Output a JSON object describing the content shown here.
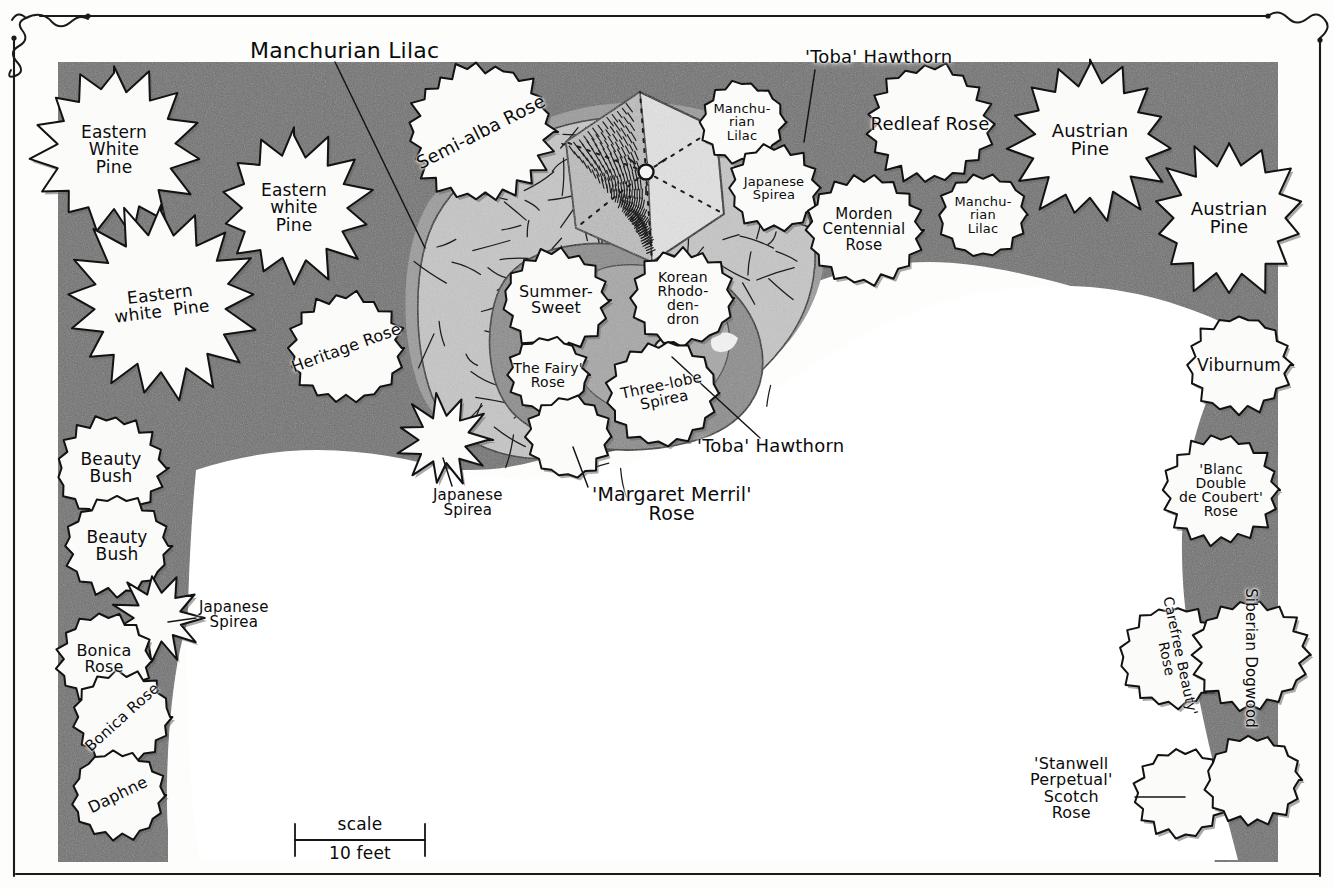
{
  "document": {
    "type": "landscape-planting-plan",
    "title": "Residential Foundation Planting Plan",
    "medium": "hand-drawn pen and ink with grey marker tone"
  },
  "scale_bar": {
    "name": "scale-bar",
    "top_label": "scale",
    "bottom_label": "10 feet",
    "x": 295,
    "y": 840,
    "length_px": 130
  },
  "frame": {
    "name": "decorative-border",
    "corner_flourish": "squiggle"
  },
  "tones": {
    "paper": "#fdfdfc",
    "lawn": "#ffffff",
    "bed_dark": "#6d6d6d",
    "bed_mid": "#8f8f8f",
    "bed_light": "#b4b4b4",
    "paving": "#c9c9c9",
    "plant_fill": "#fbfbfa",
    "ink": "#111111"
  },
  "plants": [
    {
      "id": "eastern-white-pine-1",
      "label": "Eastern\nWhite\nPine",
      "cx": 114,
      "cy": 150,
      "r": 66,
      "shape": "conifer",
      "rot": 0,
      "fs": 17
    },
    {
      "id": "eastern-white-pine-2",
      "label": "Eastern\nwhite\nPine",
      "cx": 294,
      "cy": 208,
      "r": 60,
      "shape": "conifer",
      "rot": 0,
      "fs": 17
    },
    {
      "id": "eastern-white-pine-3",
      "label": "Eastern\nwhite  Pine",
      "cx": 161,
      "cy": 303,
      "r": 76,
      "shape": "conifer",
      "rot": -7,
      "fs": 17
    },
    {
      "id": "semi-alba-rose",
      "label": "Semi-alba Rose",
      "cx": 481,
      "cy": 132,
      "r": 68,
      "shape": "shrub",
      "rot": -27,
      "fs": 18
    },
    {
      "id": "heritage-rose",
      "label": "Heritage Rose",
      "cx": 346,
      "cy": 348,
      "r": 54,
      "shape": "shrub",
      "rot": -20,
      "fs": 16
    },
    {
      "id": "beauty-bush-1",
      "label": "Beauty\nBush",
      "cx": 111,
      "cy": 468,
      "r": 51,
      "shape": "shrub",
      "rot": 0,
      "fs": 17
    },
    {
      "id": "beauty-bush-2",
      "label": "Beauty\nBush",
      "cx": 117,
      "cy": 546,
      "r": 49,
      "shape": "shrub",
      "rot": 0,
      "fs": 17
    },
    {
      "id": "japanese-spirea-left",
      "label": "",
      "cx": 158,
      "cy": 618,
      "r": 35,
      "shape": "spiky",
      "rot": 0,
      "fs": 13
    },
    {
      "id": "bonica-rose-1",
      "label": "Bonica\nRose",
      "cx": 104,
      "cy": 659,
      "r": 44,
      "shape": "shrub",
      "rot": 0,
      "fs": 16
    },
    {
      "id": "bonica-rose-2",
      "label": "Bonica Rose",
      "cx": 122,
      "cy": 717,
      "r": 46,
      "shape": "shrub",
      "rot": -42,
      "fs": 15
    },
    {
      "id": "daphne",
      "label": "Daphne",
      "cx": 118,
      "cy": 795,
      "r": 44,
      "shape": "shrub",
      "rot": -26,
      "fs": 16
    },
    {
      "id": "summer-sweet",
      "label": "Summer-\nSweet",
      "cx": 556,
      "cy": 300,
      "r": 50,
      "shape": "shrub",
      "rot": 0,
      "fs": 16
    },
    {
      "id": "the-fairy-rose",
      "label": "The Fairy'\nRose",
      "cx": 548,
      "cy": 375,
      "r": 38,
      "shape": "shrub",
      "rot": 0,
      "fs": 14
    },
    {
      "id": "korean-rhododendron",
      "label": "Korean\nRhodo-\nden-\ndron",
      "cx": 683,
      "cy": 298,
      "r": 48,
      "shape": "shrub",
      "rot": 0,
      "fs": 14
    },
    {
      "id": "three-lobe-spirea",
      "label": "Three-lobe\nSpirea",
      "cx": 663,
      "cy": 393,
      "r": 52,
      "shape": "shrub",
      "rot": -12,
      "fs": 15
    },
    {
      "id": "margaret-merril-rose",
      "label": "",
      "cx": 568,
      "cy": 437,
      "r": 40,
      "shape": "shrub",
      "rot": 0,
      "fs": 13
    },
    {
      "id": "japanese-spirea-mid",
      "label": "",
      "cx": 443,
      "cy": 440,
      "r": 36,
      "shape": "spiky",
      "rot": 0,
      "fs": 13
    },
    {
      "id": "manchurian-lilac-top",
      "label": "Manchu-\nrian\nLilac",
      "cx": 742,
      "cy": 122,
      "r": 40,
      "shape": "shrub",
      "rot": 0,
      "fs": 13
    },
    {
      "id": "japanese-spirea-top",
      "label": "Japanese\nSpirea",
      "cx": 774,
      "cy": 188,
      "r": 42,
      "shape": "shrub",
      "rot": 0,
      "fs": 13
    },
    {
      "id": "redleaf-rose",
      "label": "Redleaf Rose",
      "cx": 930,
      "cy": 124,
      "r": 58,
      "shape": "shrub",
      "rot": 0,
      "fs": 18
    },
    {
      "id": "morden-centennial",
      "label": "Morden\nCentennial\nRose",
      "cx": 864,
      "cy": 230,
      "r": 54,
      "shape": "shrub",
      "rot": 0,
      "fs": 15
    },
    {
      "id": "manchurian-lilac-right",
      "label": "Manchu-\nrian\nLilac",
      "cx": 983,
      "cy": 215,
      "r": 42,
      "shape": "shrub",
      "rot": 0,
      "fs": 13
    },
    {
      "id": "austrian-pine-1",
      "label": "Austrian\nPine",
      "cx": 1090,
      "cy": 140,
      "r": 64,
      "shape": "conifer",
      "rot": 0,
      "fs": 18
    },
    {
      "id": "austrian-pine-2",
      "label": "Austrian\nPine",
      "cx": 1229,
      "cy": 218,
      "r": 62,
      "shape": "conifer",
      "rot": 0,
      "fs": 18
    },
    {
      "id": "viburnum",
      "label": "Viburnum",
      "cx": 1239,
      "cy": 365,
      "r": 48,
      "shape": "shrub",
      "rot": 0,
      "fs": 17
    },
    {
      "id": "blanc-double-coubert",
      "label": "'Blanc\nDouble\nde Coubert'\nRose",
      "cx": 1221,
      "cy": 490,
      "r": 54,
      "shape": "shrub",
      "rot": 0,
      "fs": 14
    },
    {
      "id": "carefree-beauty-rose",
      "label": "Carefree Beauty'\nRose",
      "cx": 1173,
      "cy": 657,
      "r": 50,
      "shape": "shrub",
      "rot": 78,
      "fs": 14
    },
    {
      "id": "siberian-dogwood",
      "label": "Siberian Dogwood",
      "cx": 1250,
      "cy": 655,
      "r": 54,
      "shape": "shrub",
      "rot": 90,
      "fs": 15
    },
    {
      "id": "stanwell-perpetual",
      "label": "",
      "cx": 1181,
      "cy": 793,
      "r": 44,
      "shape": "shrub",
      "rot": 0,
      "fs": 13
    },
    {
      "id": "dogwood-lower",
      "label": "",
      "cx": 1253,
      "cy": 780,
      "r": 44,
      "shape": "shrub",
      "rot": 0,
      "fs": 13
    }
  ],
  "callouts": [
    {
      "id": "manchurian-lilac-callout",
      "label": "Manchurian Lilac",
      "x": 250,
      "y": 40,
      "fs": 22,
      "line": [
        [
          335,
          62
        ],
        [
          425,
          248
        ]
      ]
    },
    {
      "id": "toba-hawthorn-top",
      "label": "'Toba' Hawthorn",
      "x": 805,
      "y": 48,
      "fs": 18,
      "line": [
        [
          815,
          70
        ],
        [
          804,
          142
        ]
      ]
    },
    {
      "id": "toba-hawthorn-lower",
      "label": "'Toba' Hawthorn",
      "x": 697,
      "y": 437,
      "fs": 18,
      "line": [
        [
          760,
          438
        ],
        [
          672,
          357
        ]
      ]
    },
    {
      "id": "japanese-spirea-callout",
      "label": "Japanese\nSpirea",
      "x": 199,
      "y": 600,
      "fs": 15,
      "line": [
        [
          196,
          618
        ],
        [
          168,
          622
        ]
      ]
    },
    {
      "id": "japanese-spirea-bottom",
      "label": "Japanese\nSpirea",
      "x": 433,
      "y": 488,
      "fs": 15,
      "line": [
        [
          452,
          486
        ],
        [
          443,
          458
        ]
      ]
    },
    {
      "id": "margaret-merril-callout",
      "label": "'Margaret Merril'\nRose",
      "x": 592,
      "y": 485,
      "fs": 19,
      "line": [
        [
          588,
          487
        ],
        [
          573,
          447
        ]
      ]
    },
    {
      "id": "stanwell-callout",
      "label": "'Stanwell\nPerpetual'\nScotch\nRose",
      "x": 1030,
      "y": 756,
      "fs": 16,
      "line": [
        [
          1135,
          797
        ],
        [
          1185,
          797
        ]
      ]
    }
  ],
  "features": [
    {
      "id": "hexagonal-patio",
      "name": "hexagonal-paved-terrace",
      "note": "brick-and-flagstone hexagon with radiating joint pattern and centre point"
    },
    {
      "id": "flagstone-path",
      "name": "flagstone-walkway",
      "note": "irregular flagstone paving sweeping through centre of bed"
    },
    {
      "id": "lawn-area",
      "name": "open-lawn",
      "note": "large white open lawn in centre and lower portion"
    }
  ]
}
